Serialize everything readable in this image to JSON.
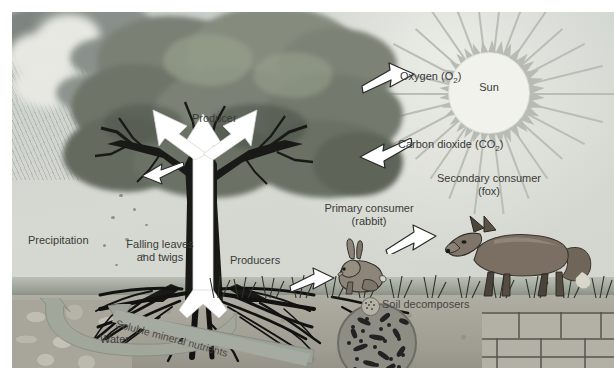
{
  "diagram": {
    "labels": {
      "sun": "Sun",
      "oxygen": "Oxygen (O",
      "oxygen_sub": "2",
      "oxygen_end": ")",
      "oxygen_full": "Oxygen (O2)",
      "carbon_dioxide": "Carbon dioxide (CO",
      "carbon_dioxide_sub": "2",
      "carbon_dioxide_end": ")",
      "carbon_dioxide_full": "Carbon dioxide (CO2)",
      "producer": "Producer",
      "producers": "Producers",
      "precipitation": "Precipitation",
      "falling_leaves_line1": "Falling leaves",
      "falling_leaves_line2": "and twigs",
      "primary_consumer_line1": "Primary consumer",
      "primary_consumer_line2": "(rabbit)",
      "secondary_consumer_line1": "Secondary consumer",
      "secondary_consumer_line2": "(fox)",
      "soil_decomposers": "Soil decomposers",
      "water": "Water",
      "soluble_mineral_nutrients": "Soluble mineral nutrients"
    },
    "icons": {
      "sun": "sun-icon",
      "oxygen_arrow": "arrow-right-outline-icon",
      "co2_arrow": "arrow-left-outline-icon",
      "sap_flow": "arrow-up-white-icon",
      "water_cycle": "curved-arrow-icon",
      "mineral_uptake": "diagonal-arrow-icon",
      "bacteria_inset": "bacteria-circle-icon",
      "decomposer_marker": "decomposer-dot-icon",
      "grazing_arrow": "arrow-outline-icon",
      "predation_arrow": "arrow-outline-icon"
    },
    "colors": {
      "sky": "#cfd4ce",
      "sun_disc": "#f2f2ec",
      "sun_ray": "#b9bdb6",
      "foliage_dark": "#565c52",
      "foliage_mid": "#7f8679",
      "foliage_light": "#a9b09f",
      "trunk": "#191a18",
      "soil": "#a7a59a",
      "rock": "#b6b4a8",
      "fox": "#7a6f62",
      "rabbit": "#8d8579",
      "grass": "#8b9181",
      "text": "#3a3a38",
      "arrow_outline": "#2b2b29",
      "arrow_fill": "#ffffff",
      "cycle_arrow": "#9ea399"
    }
  }
}
